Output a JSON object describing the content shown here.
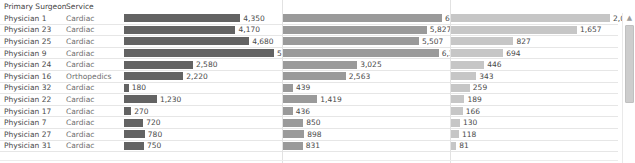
{
  "columns": {
    "surgeon_header": "Primary Surgeon",
    "service_header": "Service"
  },
  "scrollbar": {
    "up_arrow": "▲"
  },
  "chart_data": {
    "type": "bar",
    "title": "",
    "xlabel": "",
    "ylabel": "",
    "orientation": "horizontal",
    "grid": true,
    "legend": "none",
    "categories": [
      "Physician 1",
      "Physician 23",
      "Physician 25",
      "Physician 9",
      "Physician 24",
      "Physician 16",
      "Physician 32",
      "Physician 22",
      "Physician 17",
      "Physician 7",
      "Physician 27",
      "Physician 31"
    ],
    "service": [
      "Cardiac",
      "Cardiac",
      "Cardiac",
      "Cardiac",
      "Cardiac",
      "Orthopedics",
      "Cardiac",
      "Cardiac",
      "Cardiac",
      "Cardiac",
      "Cardiac",
      "Cardiac"
    ],
    "series": [
      {
        "name": "measure-1",
        "color": "#636363",
        "max": 5610,
        "values": [
          4350,
          4170,
          4680,
          5610,
          2580,
          2220,
          180,
          1230,
          270,
          720,
          780,
          750
        ],
        "labels": [
          "4,350",
          "4,170",
          "4,680",
          "5,610",
          "2,580",
          "2,220",
          "180",
          "1,230",
          "270",
          "720",
          "780",
          "750"
        ]
      },
      {
        "name": "measure-2",
        "color": "#9a9a9a",
        "max": 6437,
        "values": [
          6437,
          5827,
          5507,
          6304,
          3025,
          2563,
          439,
          1419,
          436,
          850,
          898,
          831
        ],
        "labels": [
          "6,437",
          "5,827",
          "5,507",
          "6,304",
          "3,025",
          "2,563",
          "439",
          "1,419",
          "436",
          "850",
          "898",
          "831"
        ]
      },
      {
        "name": "measure-3",
        "color": "#c6c6c6",
        "max": 2087,
        "values": [
          2087,
          1657,
          827,
          694,
          446,
          343,
          259,
          189,
          166,
          130,
          118,
          81
        ],
        "labels": [
          "2,087",
          "1,657",
          "827",
          "694",
          "446",
          "343",
          "259",
          "189",
          "166",
          "130",
          "118",
          "81"
        ]
      }
    ]
  }
}
